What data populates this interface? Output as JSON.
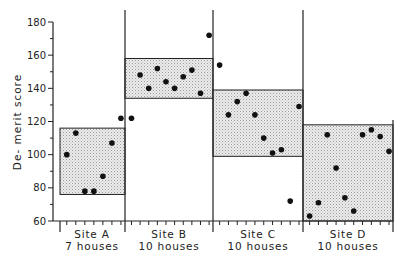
{
  "chart_data": {
    "type": "scatter",
    "title": "",
    "xlabel": "",
    "ylabel": "De-merit score",
    "ylim": [
      60,
      180
    ],
    "yticks": [
      60,
      80,
      100,
      120,
      140,
      160,
      180
    ],
    "grid": false,
    "legend": null,
    "groups": [
      {
        "name": "Site A",
        "sublabel": "7 houses",
        "box": {
          "low": 76,
          "high": 116
        },
        "values": [
          100,
          113,
          78,
          78,
          87,
          107,
          122
        ]
      },
      {
        "name": "Site B",
        "sublabel": "10 houses",
        "box": {
          "low": 134,
          "high": 158
        },
        "values": [
          122,
          148,
          140,
          152,
          144,
          140,
          147,
          151,
          137,
          172
        ]
      },
      {
        "name": "Site C",
        "sublabel": "10 houses",
        "box": {
          "low": 99,
          "high": 139
        },
        "values": [
          154,
          124,
          132,
          137,
          124,
          110,
          101,
          103,
          72,
          129
        ]
      },
      {
        "name": "Site D",
        "sublabel": "10 houses",
        "box": {
          "low": 60,
          "high": 118
        },
        "values": [
          63,
          71,
          112,
          92,
          74,
          66,
          112,
          115,
          111,
          102
        ]
      }
    ]
  },
  "labels": {
    "ylabel": "De- merit score",
    "yticks": [
      "60",
      "80",
      "100",
      "120",
      "140",
      "160",
      "180"
    ],
    "groups": [
      {
        "name": "Site A",
        "sublabel": "7 houses"
      },
      {
        "name": "Site B",
        "sublabel": "10 houses"
      },
      {
        "name": "Site C",
        "sublabel": "10 houses"
      },
      {
        "name": "Site D",
        "sublabel": "10 houses"
      }
    ]
  },
  "colors": {
    "axis": "#222222",
    "box_fill": "#e2e2e2",
    "point": "#111111"
  }
}
